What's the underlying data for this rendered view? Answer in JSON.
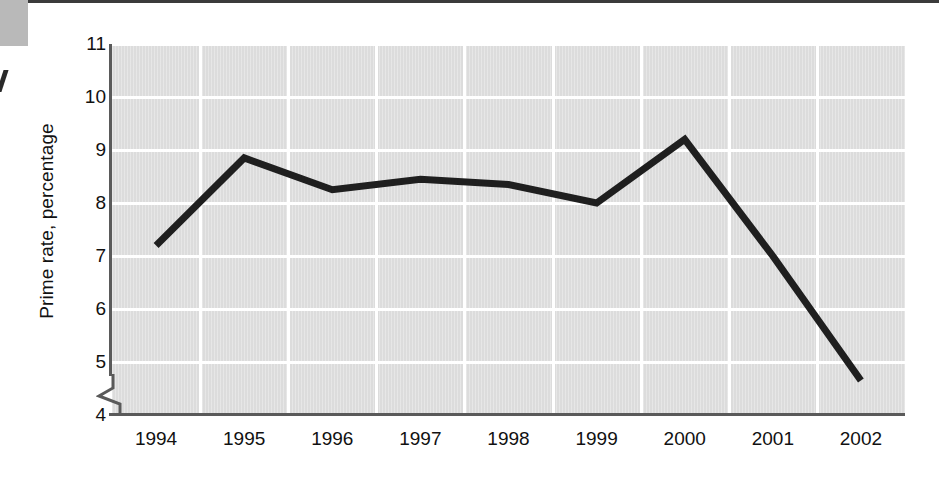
{
  "chart_data": {
    "type": "line",
    "title": "",
    "subtitle": "",
    "xlabel": "",
    "ylabel": "Prime rate, percentage",
    "categories": [
      "1994",
      "1995",
      "1996",
      "1997",
      "1998",
      "1999",
      "2000",
      "2001",
      "2002"
    ],
    "x": [
      1994,
      1995,
      1996,
      1997,
      1998,
      1999,
      2000,
      2001,
      2002
    ],
    "values": [
      7.2,
      8.85,
      8.25,
      8.45,
      8.35,
      8.0,
      9.2,
      7.0,
      4.65
    ],
    "series": [
      {
        "name": "Prime rate",
        "values": [
          7.2,
          8.85,
          8.25,
          8.45,
          8.35,
          8.0,
          9.2,
          7.0,
          4.65
        ]
      }
    ],
    "ylim": [
      4,
      11
    ],
    "yticks": [
      4,
      5,
      6,
      7,
      8,
      9,
      10,
      11
    ],
    "ytick_labels": [
      "4",
      "5",
      "6",
      "7",
      "8",
      "9",
      "10",
      "11"
    ],
    "xtick_labels": [
      "1994",
      "1995",
      "1996",
      "1997",
      "1998",
      "1999",
      "2000",
      "2001",
      "2002"
    ],
    "grid": true,
    "grid_color": "#ffffff",
    "plot_background": "#dcdcdc",
    "line_color": "#1f1f1f",
    "axis_color": "#5a5a5a",
    "legend": null,
    "legend_position": "none",
    "y_axis_break": true,
    "annotations": []
  },
  "figure": {
    "y_axis_title": "Prime rate, percentage"
  }
}
